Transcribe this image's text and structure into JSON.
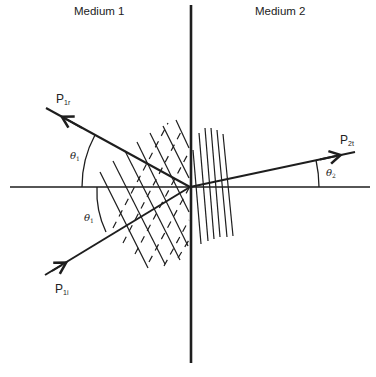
{
  "diagram": {
    "title": "",
    "regions": {
      "left": {
        "label": "Medium 1"
      },
      "right": {
        "label": "Medium 2"
      }
    },
    "rays": {
      "incident": {
        "label": "P",
        "subscript": "1i"
      },
      "reflected": {
        "label": "P",
        "subscript": "1r"
      },
      "transmitted": {
        "label": "P",
        "subscript": "2t"
      }
    },
    "angles": {
      "incidence": {
        "symbol": "θ",
        "subscript": "1"
      },
      "reflection": {
        "symbol": "θ",
        "subscript": "1"
      },
      "transmission": {
        "symbol": "θ",
        "subscript": "2"
      }
    },
    "colors": {
      "line": "#1e1e1e",
      "background": "#ffffff"
    }
  }
}
